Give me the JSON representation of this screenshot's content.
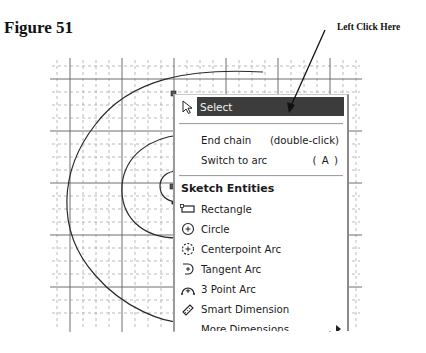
{
  "figure": {
    "title": "Figure 51"
  },
  "callout": {
    "text": "Left Click Here"
  },
  "colors": {
    "highlight_bg": "#3c3c3c",
    "highlight_text": "#f2f2f2",
    "grid_major": "#707070",
    "grid_minor": "#a8a8a8",
    "sketch_line": "#2a2a2a"
  },
  "menu": {
    "select": {
      "label": "Select",
      "icon": "pointer-arrow-icon"
    },
    "items": [
      {
        "label": "End chain",
        "shortcut": "(double-click)"
      },
      {
        "label": "Switch to arc",
        "shortcut": "( A )"
      }
    ],
    "group": {
      "heading": "Sketch Entities",
      "items": [
        {
          "label": "Rectangle",
          "icon": "rectangle-icon"
        },
        {
          "label": "Circle",
          "icon": "circle-icon"
        },
        {
          "label": "Centerpoint Arc",
          "icon": "centerpoint-arc-icon"
        },
        {
          "label": "Tangent Arc",
          "icon": "tangent-arc-icon"
        },
        {
          "label": "3 Point Arc",
          "icon": "three-point-arc-icon"
        },
        {
          "label": "Smart Dimension",
          "icon": "smart-dimension-icon"
        },
        {
          "label": "More Dimensions",
          "icon": "submenu-arrow-icon",
          "truncated": true
        }
      ]
    }
  }
}
